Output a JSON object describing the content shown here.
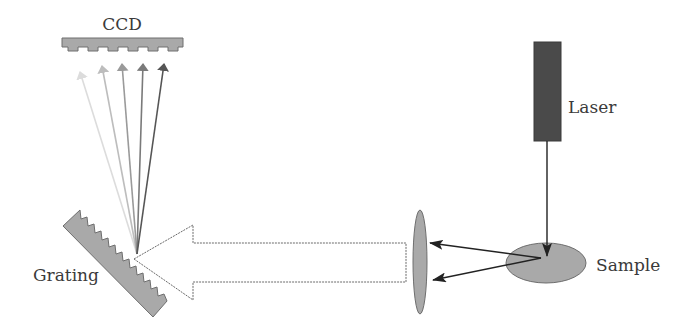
{
  "labels": {
    "ccd": "CCD",
    "laser": "Laser",
    "sample": "Sample",
    "grating": "Grating"
  },
  "components": {
    "ccd": {
      "icon": "ccd-detector-icon",
      "color": "#a9a9a9"
    },
    "grating": {
      "icon": "diffraction-grating-icon",
      "color": "#a9a9a9"
    },
    "lens": {
      "icon": "lens-icon",
      "color": "#a9a9a9"
    },
    "laser": {
      "icon": "laser-source-icon",
      "color": "#4a4a4a"
    },
    "sample": {
      "icon": "sample-icon",
      "color": "#a9a9a9"
    },
    "collected_beam": {
      "icon": "hollow-arrow-icon",
      "color": "#ffffff",
      "stroke": "#6a6a6a"
    }
  },
  "dispersed_rays": [
    {
      "color": "#dcdcdc"
    },
    {
      "color": "#bdbdbd"
    },
    {
      "color": "#9a9a9a"
    },
    {
      "color": "#7a7a7a"
    },
    {
      "color": "#555555"
    }
  ],
  "scattered_rays_count": 2
}
